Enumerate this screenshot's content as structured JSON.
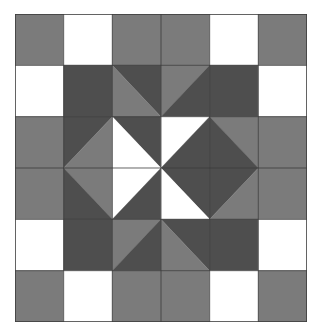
{
  "image": {
    "title": "Quilt Block Pattern",
    "kind": "geometric-quilt-block",
    "width_px": 323,
    "height_px": 334,
    "background_color": "#ffffff"
  },
  "block": {
    "name": "six-by-six-star-quilt-block",
    "origin_x": 15,
    "origin_y": 14,
    "width_px": 292,
    "height_px": 308,
    "grid_columns": 6,
    "grid_rows": 6,
    "cell_width": 48.6667,
    "cell_height": 51.3333,
    "gridline_color": "#3d3d3d",
    "gridline_width": 0.8
  },
  "palette": {
    "light": "#ffffff",
    "medium_gray": "#7b7b7b",
    "dark_gray": "#4e4e4e",
    "outline": "#3d3d3d",
    "background": "#ffffff"
  },
  "legend": [
    {
      "key": "light",
      "label": "Light / White patch",
      "color": "#ffffff"
    },
    {
      "key": "medium_gray",
      "label": "Medium gray patch",
      "color": "#7b7b7b"
    },
    {
      "key": "dark_gray",
      "label": "Dark gray patch",
      "color": "#4e4e4e"
    }
  ],
  "cells": [
    {
      "row": 0,
      "col": 0,
      "name": "cell-r0c0",
      "type": "solid",
      "fill": "medium_gray"
    },
    {
      "row": 0,
      "col": 1,
      "name": "cell-r0c1",
      "type": "solid",
      "fill": "light"
    },
    {
      "row": 0,
      "col": 2,
      "name": "cell-r0c2",
      "type": "solid",
      "fill": "medium_gray"
    },
    {
      "row": 0,
      "col": 3,
      "name": "cell-r0c3",
      "type": "solid",
      "fill": "medium_gray"
    },
    {
      "row": 0,
      "col": 4,
      "name": "cell-r0c4",
      "type": "solid",
      "fill": "light"
    },
    {
      "row": 0,
      "col": 5,
      "name": "cell-r0c5",
      "type": "solid",
      "fill": "medium_gray"
    },
    {
      "row": 1,
      "col": 0,
      "name": "cell-r1c0",
      "type": "solid",
      "fill": "light"
    },
    {
      "row": 1,
      "col": 1,
      "name": "cell-r1c1",
      "type": "solid",
      "fill": "dark_gray"
    },
    {
      "row": 1,
      "col": 2,
      "name": "cell-r1c2",
      "type": "diagonal",
      "diagonal": "tl-br",
      "fill_a": "dark_gray",
      "fill_b": "medium_gray"
    },
    {
      "row": 1,
      "col": 3,
      "name": "cell-r1c3",
      "type": "diagonal",
      "diagonal": "tr-bl",
      "fill_a": "medium_gray",
      "fill_b": "dark_gray"
    },
    {
      "row": 1,
      "col": 4,
      "name": "cell-r1c4",
      "type": "solid",
      "fill": "dark_gray"
    },
    {
      "row": 1,
      "col": 5,
      "name": "cell-r1c5",
      "type": "solid",
      "fill": "light"
    },
    {
      "row": 2,
      "col": 0,
      "name": "cell-r2c0",
      "type": "solid",
      "fill": "medium_gray"
    },
    {
      "row": 2,
      "col": 1,
      "name": "cell-r2c1",
      "type": "diagonal",
      "diagonal": "tr-bl",
      "fill_a": "dark_gray",
      "fill_b": "medium_gray"
    },
    {
      "row": 2,
      "col": 2,
      "name": "cell-r2c2",
      "type": "diagonal",
      "diagonal": "tl-br",
      "fill_a": "dark_gray",
      "fill_b": "light"
    },
    {
      "row": 2,
      "col": 3,
      "name": "cell-r2c3",
      "type": "diagonal",
      "diagonal": "tr-bl",
      "fill_a": "light",
      "fill_b": "dark_gray"
    },
    {
      "row": 2,
      "col": 4,
      "name": "cell-r2c4",
      "type": "diagonal",
      "diagonal": "tl-br",
      "fill_a": "medium_gray",
      "fill_b": "dark_gray"
    },
    {
      "row": 2,
      "col": 5,
      "name": "cell-r2c5",
      "type": "solid",
      "fill": "medium_gray"
    },
    {
      "row": 3,
      "col": 0,
      "name": "cell-r3c0",
      "type": "solid",
      "fill": "medium_gray"
    },
    {
      "row": 3,
      "col": 1,
      "name": "cell-r3c1",
      "type": "diagonal",
      "diagonal": "tl-br",
      "fill_a": "medium_gray",
      "fill_b": "dark_gray"
    },
    {
      "row": 3,
      "col": 2,
      "name": "cell-r3c2",
      "type": "diagonal",
      "diagonal": "tr-bl",
      "fill_a": "light",
      "fill_b": "dark_gray"
    },
    {
      "row": 3,
      "col": 3,
      "name": "cell-r3c3",
      "type": "diagonal",
      "diagonal": "tl-br",
      "fill_a": "dark_gray",
      "fill_b": "light"
    },
    {
      "row": 3,
      "col": 4,
      "name": "cell-r3c4",
      "type": "diagonal",
      "diagonal": "tr-bl",
      "fill_a": "dark_gray",
      "fill_b": "medium_gray"
    },
    {
      "row": 3,
      "col": 5,
      "name": "cell-r3c5",
      "type": "solid",
      "fill": "medium_gray"
    },
    {
      "row": 4,
      "col": 0,
      "name": "cell-r4c0",
      "type": "solid",
      "fill": "light"
    },
    {
      "row": 4,
      "col": 1,
      "name": "cell-r4c1",
      "type": "solid",
      "fill": "dark_gray"
    },
    {
      "row": 4,
      "col": 2,
      "name": "cell-r4c2",
      "type": "diagonal",
      "diagonal": "tr-bl",
      "fill_a": "medium_gray",
      "fill_b": "dark_gray"
    },
    {
      "row": 4,
      "col": 3,
      "name": "cell-r4c3",
      "type": "diagonal",
      "diagonal": "tl-br",
      "fill_a": "dark_gray",
      "fill_b": "medium_gray"
    },
    {
      "row": 4,
      "col": 4,
      "name": "cell-r4c4",
      "type": "solid",
      "fill": "dark_gray"
    },
    {
      "row": 4,
      "col": 5,
      "name": "cell-r4c5",
      "type": "solid",
      "fill": "light"
    },
    {
      "row": 5,
      "col": 0,
      "name": "cell-r5c0",
      "type": "solid",
      "fill": "medium_gray"
    },
    {
      "row": 5,
      "col": 1,
      "name": "cell-r5c1",
      "type": "solid",
      "fill": "light"
    },
    {
      "row": 5,
      "col": 2,
      "name": "cell-r5c2",
      "type": "solid",
      "fill": "medium_gray"
    },
    {
      "row": 5,
      "col": 3,
      "name": "cell-r5c3",
      "type": "solid",
      "fill": "medium_gray"
    },
    {
      "row": 5,
      "col": 4,
      "name": "cell-r5c4",
      "type": "solid",
      "fill": "light"
    },
    {
      "row": 5,
      "col": 5,
      "name": "cell-r5c5",
      "type": "solid",
      "fill": "medium_gray"
    }
  ],
  "gridlines": {
    "vertical_columns": [
      1,
      2,
      3,
      4,
      5
    ],
    "horizontal_rows": [
      1,
      2,
      3,
      4,
      5
    ],
    "border": true
  }
}
